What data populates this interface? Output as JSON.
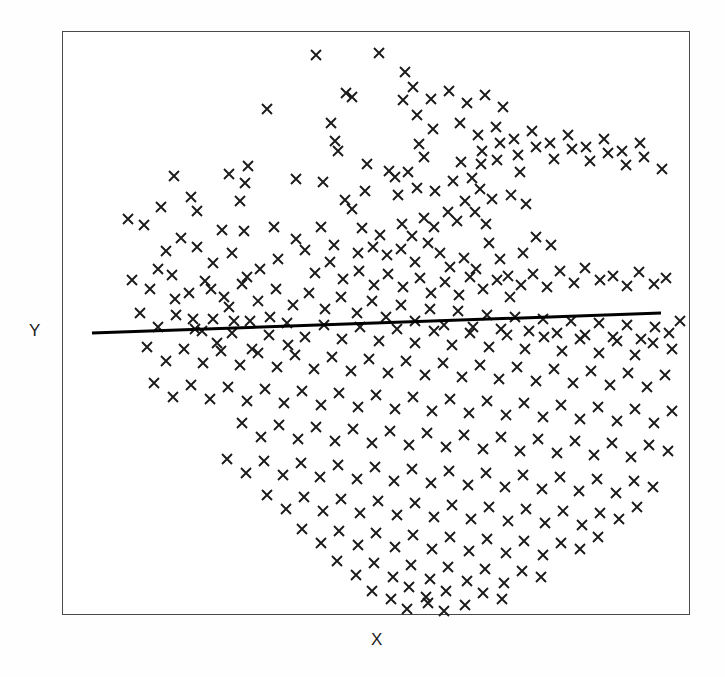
{
  "figure": {
    "background_color": "#fefefe",
    "plot_background_color": "#ffffff",
    "frame_color": "#4a4a4a",
    "marker_color": "#1a1a1a",
    "line_color": "#000000"
  },
  "labels": {
    "x": "X",
    "y": "Y"
  },
  "chart_data": {
    "type": "scatter",
    "title": "",
    "xlabel": "X",
    "ylabel": "Y",
    "grid": false,
    "legend": null,
    "axis_ticks": false,
    "axis_tick_labels": false,
    "marker": "x",
    "marker_size": 10,
    "n_points": 398,
    "xlim": [
      0,
      628
    ],
    "ylim": [
      0,
      584
    ],
    "note": "Axes are unlabeled/unscaled; point coordinates are given in plot-frame pixel space with origin at the frame top-left corner (62,31) in page coordinates.",
    "trendline": {
      "type": "linear-fit",
      "color": "#000000",
      "width": 3,
      "x_start": 30,
      "y_start": 302,
      "x_end": 599,
      "y_end": 282,
      "slope_sign": "slightly positive"
    },
    "points": [
      [
        254,
        24
      ],
      [
        317,
        22
      ],
      [
        343,
        41
      ],
      [
        284,
        62
      ],
      [
        290,
        66
      ],
      [
        341,
        69
      ],
      [
        205,
        78
      ],
      [
        269,
        92
      ],
      [
        355,
        84
      ],
      [
        371,
        98
      ],
      [
        273,
        110
      ],
      [
        276,
        120
      ],
      [
        357,
        113
      ],
      [
        362,
        126
      ],
      [
        186,
        135
      ],
      [
        305,
        133
      ],
      [
        183,
        152
      ],
      [
        234,
        148
      ],
      [
        261,
        151
      ],
      [
        327,
        140
      ],
      [
        333,
        146
      ],
      [
        346,
        141
      ],
      [
        399,
        131
      ],
      [
        419,
        133
      ],
      [
        112,
        145
      ],
      [
        167,
        143
      ],
      [
        178,
        170
      ],
      [
        283,
        169
      ],
      [
        290,
        178
      ],
      [
        303,
        160
      ],
      [
        336,
        164
      ],
      [
        355,
        157
      ],
      [
        373,
        160
      ],
      [
        391,
        150
      ],
      [
        410,
        147
      ],
      [
        418,
        158
      ],
      [
        435,
        129
      ],
      [
        458,
        141
      ],
      [
        99,
        176
      ],
      [
        129,
        166
      ],
      [
        135,
        180
      ],
      [
        182,
        200
      ],
      [
        259,
        196
      ],
      [
        300,
        197
      ],
      [
        318,
        204
      ],
      [
        340,
        193
      ],
      [
        350,
        205
      ],
      [
        362,
        187
      ],
      [
        372,
        196
      ],
      [
        386,
        181
      ],
      [
        395,
        190
      ],
      [
        403,
        170
      ],
      [
        413,
        181
      ],
      [
        424,
        193
      ],
      [
        430,
        168
      ],
      [
        449,
        164
      ],
      [
        464,
        173
      ],
      [
        66,
        188
      ],
      [
        82,
        194
      ],
      [
        119,
        207
      ],
      [
        160,
        199
      ],
      [
        212,
        196
      ],
      [
        234,
        208
      ],
      [
        243,
        219
      ],
      [
        272,
        214
      ],
      [
        296,
        222
      ],
      [
        311,
        216
      ],
      [
        325,
        224
      ],
      [
        339,
        218
      ],
      [
        353,
        231
      ],
      [
        366,
        212
      ],
      [
        378,
        222
      ],
      [
        388,
        236
      ],
      [
        402,
        227
      ],
      [
        414,
        238
      ],
      [
        427,
        212
      ],
      [
        438,
        228
      ],
      [
        446,
        245
      ],
      [
        461,
        222
      ],
      [
        474,
        206
      ],
      [
        489,
        214
      ],
      [
        104,
        220
      ],
      [
        135,
        216
      ],
      [
        151,
        232
      ],
      [
        170,
        222
      ],
      [
        198,
        238
      ],
      [
        216,
        228
      ],
      [
        253,
        242
      ],
      [
        268,
        231
      ],
      [
        281,
        248
      ],
      [
        297,
        240
      ],
      [
        312,
        254
      ],
      [
        326,
        243
      ],
      [
        341,
        256
      ],
      [
        358,
        247
      ],
      [
        369,
        262
      ],
      [
        383,
        251
      ],
      [
        397,
        264
      ],
      [
        408,
        246
      ],
      [
        421,
        258
      ],
      [
        435,
        249
      ],
      [
        448,
        266
      ],
      [
        459,
        254
      ],
      [
        471,
        243
      ],
      [
        485,
        256
      ],
      [
        498,
        240
      ],
      [
        512,
        252
      ],
      [
        523,
        237
      ],
      [
        538,
        249
      ],
      [
        551,
        245
      ],
      [
        565,
        255
      ],
      [
        577,
        241
      ],
      [
        592,
        253
      ],
      [
        604,
        247
      ],
      [
        70,
        249
      ],
      [
        88,
        258
      ],
      [
        110,
        244
      ],
      [
        127,
        262
      ],
      [
        143,
        250
      ],
      [
        162,
        266
      ],
      [
        180,
        253
      ],
      [
        196,
        270
      ],
      [
        214,
        258
      ],
      [
        231,
        274
      ],
      [
        247,
        262
      ],
      [
        263,
        278
      ],
      [
        279,
        266
      ],
      [
        295,
        282
      ],
      [
        310,
        270
      ],
      [
        324,
        286
      ],
      [
        339,
        274
      ],
      [
        353,
        290
      ],
      [
        368,
        278
      ],
      [
        382,
        294
      ],
      [
        396,
        280
      ],
      [
        411,
        296
      ],
      [
        425,
        284
      ],
      [
        439,
        298
      ],
      [
        453,
        286
      ],
      [
        467,
        300
      ],
      [
        481,
        288
      ],
      [
        495,
        302
      ],
      [
        509,
        290
      ],
      [
        523,
        304
      ],
      [
        537,
        292
      ],
      [
        551,
        306
      ],
      [
        565,
        294
      ],
      [
        579,
        308
      ],
      [
        593,
        296
      ],
      [
        607,
        302
      ],
      [
        618,
        290
      ],
      [
        78,
        282
      ],
      [
        96,
        296
      ],
      [
        114,
        284
      ],
      [
        133,
        298
      ],
      [
        151,
        288
      ],
      [
        170,
        302
      ],
      [
        188,
        290
      ],
      [
        207,
        304
      ],
      [
        225,
        292
      ],
      [
        243,
        306
      ],
      [
        262,
        294
      ],
      [
        280,
        308
      ],
      [
        298,
        296
      ],
      [
        317,
        310
      ],
      [
        335,
        298
      ],
      [
        353,
        312
      ],
      [
        372,
        300
      ],
      [
        390,
        314
      ],
      [
        408,
        302
      ],
      [
        427,
        316
      ],
      [
        445,
        304
      ],
      [
        463,
        318
      ],
      [
        482,
        306
      ],
      [
        500,
        320
      ],
      [
        518,
        308
      ],
      [
        537,
        322
      ],
      [
        555,
        310
      ],
      [
        573,
        324
      ],
      [
        591,
        312
      ],
      [
        610,
        318
      ],
      [
        85,
        316
      ],
      [
        104,
        330
      ],
      [
        122,
        318
      ],
      [
        141,
        332
      ],
      [
        159,
        320
      ],
      [
        178,
        334
      ],
      [
        196,
        322
      ],
      [
        215,
        336
      ],
      [
        233,
        324
      ],
      [
        252,
        338
      ],
      [
        270,
        326
      ],
      [
        289,
        340
      ],
      [
        307,
        328
      ],
      [
        326,
        342
      ],
      [
        344,
        330
      ],
      [
        363,
        344
      ],
      [
        381,
        332
      ],
      [
        400,
        346
      ],
      [
        418,
        334
      ],
      [
        437,
        348
      ],
      [
        455,
        336
      ],
      [
        474,
        350
      ],
      [
        492,
        338
      ],
      [
        511,
        352
      ],
      [
        529,
        340
      ],
      [
        548,
        354
      ],
      [
        566,
        342
      ],
      [
        585,
        356
      ],
      [
        603,
        344
      ],
      [
        92,
        352
      ],
      [
        111,
        366
      ],
      [
        129,
        354
      ],
      [
        148,
        368
      ],
      [
        166,
        356
      ],
      [
        185,
        370
      ],
      [
        203,
        358
      ],
      [
        222,
        372
      ],
      [
        240,
        360
      ],
      [
        259,
        374
      ],
      [
        277,
        362
      ],
      [
        296,
        376
      ],
      [
        314,
        364
      ],
      [
        333,
        378
      ],
      [
        351,
        366
      ],
      [
        370,
        380
      ],
      [
        388,
        368
      ],
      [
        407,
        382
      ],
      [
        425,
        370
      ],
      [
        444,
        384
      ],
      [
        462,
        372
      ],
      [
        481,
        386
      ],
      [
        499,
        374
      ],
      [
        518,
        388
      ],
      [
        536,
        376
      ],
      [
        555,
        390
      ],
      [
        573,
        378
      ],
      [
        592,
        392
      ],
      [
        610,
        380
      ],
      [
        180,
        392
      ],
      [
        199,
        406
      ],
      [
        217,
        394
      ],
      [
        236,
        408
      ],
      [
        254,
        396
      ],
      [
        273,
        410
      ],
      [
        291,
        398
      ],
      [
        310,
        412
      ],
      [
        328,
        400
      ],
      [
        347,
        414
      ],
      [
        365,
        402
      ],
      [
        384,
        416
      ],
      [
        402,
        404
      ],
      [
        421,
        418
      ],
      [
        439,
        406
      ],
      [
        458,
        420
      ],
      [
        476,
        408
      ],
      [
        495,
        422
      ],
      [
        513,
        410
      ],
      [
        532,
        424
      ],
      [
        550,
        412
      ],
      [
        569,
        426
      ],
      [
        587,
        414
      ],
      [
        606,
        420
      ],
      [
        165,
        428
      ],
      [
        184,
        442
      ],
      [
        202,
        430
      ],
      [
        221,
        444
      ],
      [
        239,
        432
      ],
      [
        258,
        446
      ],
      [
        276,
        434
      ],
      [
        295,
        448
      ],
      [
        313,
        436
      ],
      [
        332,
        450
      ],
      [
        350,
        438
      ],
      [
        369,
        452
      ],
      [
        387,
        440
      ],
      [
        406,
        454
      ],
      [
        424,
        442
      ],
      [
        443,
        456
      ],
      [
        461,
        444
      ],
      [
        480,
        458
      ],
      [
        498,
        446
      ],
      [
        517,
        460
      ],
      [
        535,
        448
      ],
      [
        554,
        462
      ],
      [
        572,
        450
      ],
      [
        591,
        456
      ],
      [
        205,
        464
      ],
      [
        224,
        478
      ],
      [
        242,
        466
      ],
      [
        261,
        480
      ],
      [
        279,
        468
      ],
      [
        298,
        482
      ],
      [
        316,
        470
      ],
      [
        335,
        484
      ],
      [
        353,
        472
      ],
      [
        372,
        486
      ],
      [
        390,
        474
      ],
      [
        409,
        488
      ],
      [
        427,
        476
      ],
      [
        446,
        490
      ],
      [
        464,
        478
      ],
      [
        483,
        492
      ],
      [
        501,
        480
      ],
      [
        520,
        494
      ],
      [
        538,
        482
      ],
      [
        557,
        488
      ],
      [
        575,
        476
      ],
      [
        240,
        498
      ],
      [
        259,
        512
      ],
      [
        277,
        500
      ],
      [
        296,
        514
      ],
      [
        314,
        502
      ],
      [
        333,
        516
      ],
      [
        351,
        504
      ],
      [
        370,
        518
      ],
      [
        388,
        506
      ],
      [
        407,
        520
      ],
      [
        425,
        508
      ],
      [
        444,
        522
      ],
      [
        462,
        510
      ],
      [
        481,
        524
      ],
      [
        499,
        512
      ],
      [
        518,
        518
      ],
      [
        536,
        506
      ],
      [
        275,
        530
      ],
      [
        294,
        544
      ],
      [
        312,
        532
      ],
      [
        331,
        546
      ],
      [
        349,
        534
      ],
      [
        368,
        548
      ],
      [
        386,
        536
      ],
      [
        405,
        550
      ],
      [
        423,
        538
      ],
      [
        442,
        552
      ],
      [
        460,
        540
      ],
      [
        479,
        546
      ],
      [
        310,
        560
      ],
      [
        329,
        568
      ],
      [
        347,
        556
      ],
      [
        366,
        572
      ],
      [
        384,
        560
      ],
      [
        403,
        574
      ],
      [
        421,
        562
      ],
      [
        440,
        568
      ],
      [
        345,
        578
      ],
      [
        364,
        566
      ],
      [
        382,
        580
      ],
      [
        140,
        300
      ],
      [
        155,
        312
      ],
      [
        172,
        290
      ],
      [
        190,
        318
      ],
      [
        208,
        286
      ],
      [
        226,
        314
      ],
      [
        96,
        238
      ],
      [
        113,
        268
      ],
      [
        131,
        288
      ],
      [
        149,
        258
      ],
      [
        167,
        276
      ],
      [
        185,
        246
      ],
      [
        420,
        120
      ],
      [
        438,
        112
      ],
      [
        456,
        124
      ],
      [
        474,
        116
      ],
      [
        492,
        128
      ],
      [
        510,
        118
      ],
      [
        528,
        130
      ],
      [
        546,
        122
      ],
      [
        564,
        134
      ],
      [
        582,
        126
      ],
      [
        600,
        138
      ],
      [
        398,
        92
      ],
      [
        416,
        104
      ],
      [
        434,
        96
      ],
      [
        452,
        108
      ],
      [
        470,
        100
      ],
      [
        488,
        112
      ],
      [
        506,
        104
      ],
      [
        524,
        116
      ],
      [
        542,
        108
      ],
      [
        560,
        120
      ],
      [
        578,
        112
      ],
      [
        351,
        56
      ],
      [
        369,
        68
      ],
      [
        387,
        60
      ],
      [
        405,
        72
      ],
      [
        423,
        64
      ],
      [
        441,
        76
      ]
    ]
  }
}
